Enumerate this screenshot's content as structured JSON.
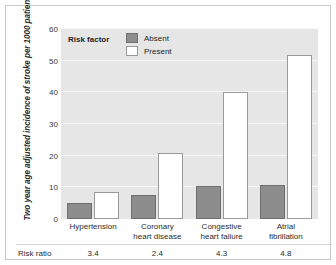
{
  "chart_data": {
    "type": "bar",
    "title": "",
    "xlabel": "",
    "ylabel": "Two year age adjusted incidence of stroke per 1000 patients",
    "ylim": [
      0,
      60
    ],
    "yticks": [
      0,
      10,
      20,
      30,
      40,
      50,
      60
    ],
    "grid": true,
    "legend_position": "top-left",
    "legend_title": "Risk factor",
    "categories": [
      "Hypertension",
      "Coronary heart disease",
      "Congestive heart failure",
      "Atrial fibrillation"
    ],
    "category_lines": [
      [
        "Hypertension"
      ],
      [
        "Coronary",
        "heart disease"
      ],
      [
        "Congestive",
        "heart failure"
      ],
      [
        "Atrial",
        "fibrillation"
      ]
    ],
    "series": [
      {
        "name": "Absent",
        "color": "#8d8d8d",
        "values": [
          5.0,
          7.5,
          10.5,
          10.7
        ]
      },
      {
        "name": "Present",
        "color": "#ffffff",
        "values": [
          8.5,
          21.0,
          40.0,
          51.8
        ]
      }
    ],
    "annotation_row": {
      "label": "Risk ratio",
      "values": [
        "3.4",
        "2.4",
        "4.3",
        "4.8"
      ]
    }
  },
  "colors": {
    "plot_background": "#e6e6e6",
    "gridline": "#f7f7f7",
    "absent_fill": "#8d8d8d",
    "absent_border": "#6f6f6f",
    "present_fill": "#ffffff",
    "present_border": "#9a9a9a",
    "frame_border": "#c9c9c9",
    "text": "#2b2b2b"
  }
}
